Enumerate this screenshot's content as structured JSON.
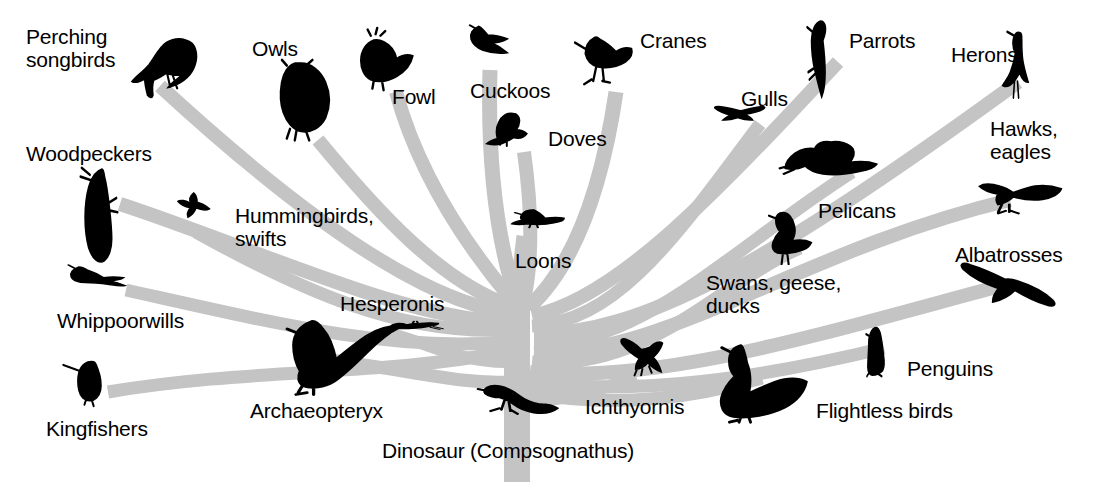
{
  "figure": {
    "kind": "phylogenetic-tree",
    "background_color": "#ffffff",
    "branch_color": "#c4c4c4",
    "silhouette_color": "#000000",
    "root_label": "Dinosaur (Compsognathus)"
  },
  "chart_data": {
    "type": "diagram",
    "title": "",
    "root": "Dinosaur (Compsognathus)",
    "node_count": 24,
    "tips": [
      "Perching songbirds",
      "Woodpeckers",
      "Hummingbirds, swifts",
      "Whippoorwills",
      "Kingfishers",
      "Owls",
      "Fowl",
      "Cuckoos",
      "Doves",
      "Cranes",
      "Parrots",
      "Gulls",
      "Herons",
      "Hawks, eagles",
      "Pelicans",
      "Albatrosses",
      "Swans, geese, ducks",
      "Penguins",
      "Flightless birds",
      "Loons",
      "Hesperonis",
      "Archaeopteryx",
      "Ichthyornis"
    ]
  },
  "taxa": [
    {
      "id": "perching-songbirds",
      "label": "Perching\nsongbirds",
      "icon": "songbird-icon",
      "label_x": 26,
      "label_y": 26,
      "label_align": "left",
      "sil_x": 131,
      "sil_y": 36,
      "sil_w": 70,
      "sil_h": 62,
      "sil_kind": "songbird"
    },
    {
      "id": "woodpeckers",
      "label": "Woodpeckers",
      "icon": "woodpecker-icon",
      "label_x": 26,
      "label_y": 143,
      "label_align": "left",
      "sil_x": 78,
      "sil_y": 166,
      "sil_w": 60,
      "sil_h": 80,
      "sil_kind": "woodpecker"
    },
    {
      "id": "hummingbirds-swifts",
      "label": "Hummingbirds,\nswifts",
      "icon": "hummingbird-icon",
      "label_x": 235,
      "label_y": 205,
      "label_align": "left",
      "sil_x": 178,
      "sil_y": 192,
      "sil_w": 56,
      "sil_h": 42,
      "sil_kind": "hummingbird"
    },
    {
      "id": "whippoorwills",
      "label": "Whippoorwills",
      "icon": "whippoorwill-icon",
      "label_x": 57,
      "label_y": 310,
      "label_align": "left",
      "sil_x": 67,
      "sil_y": 264,
      "sil_w": 76,
      "sil_h": 44,
      "sil_kind": "whippoorwill"
    },
    {
      "id": "kingfishers",
      "label": "Kingfishers",
      "icon": "kingfisher-icon",
      "label_x": 46,
      "label_y": 418,
      "label_align": "left",
      "sil_x": 62,
      "sil_y": 355,
      "sil_w": 66,
      "sil_h": 64,
      "sil_kind": "kingfisher"
    },
    {
      "id": "owls",
      "label": "Owls",
      "icon": "owl-icon",
      "label_x": 252,
      "label_y": 38,
      "label_align": "left",
      "sil_x": 266,
      "sil_y": 60,
      "sil_w": 80,
      "sil_h": 84,
      "sil_kind": "owl"
    },
    {
      "id": "fowl",
      "label": "Fowl",
      "icon": "fowl-icon",
      "label_x": 392,
      "label_y": 86,
      "label_align": "left",
      "sil_x": 350,
      "sil_y": 28,
      "sil_w": 80,
      "sil_h": 70,
      "sil_kind": "fowl"
    },
    {
      "id": "cuckoos",
      "label": "Cuckoos",
      "icon": "cuckoo-icon",
      "label_x": 470,
      "label_y": 80,
      "label_align": "left",
      "sil_x": 461,
      "sil_y": 24,
      "sil_w": 74,
      "sil_h": 56,
      "sil_kind": "cuckoo"
    },
    {
      "id": "doves",
      "label": "Doves",
      "icon": "dove-icon",
      "label_x": 548,
      "label_y": 128,
      "label_align": "left",
      "sil_x": 487,
      "sil_y": 110,
      "sil_w": 66,
      "sil_h": 56,
      "sil_kind": "dove"
    },
    {
      "id": "cranes",
      "label": "Cranes",
      "icon": "crane-icon",
      "label_x": 640,
      "label_y": 30,
      "label_align": "left",
      "sil_x": 575,
      "sil_y": 25,
      "sil_w": 76,
      "sil_h": 72,
      "sil_kind": "crane"
    },
    {
      "id": "parrots",
      "label": "Parrots",
      "icon": "parrot-icon",
      "label_x": 849,
      "label_y": 30,
      "label_align": "left",
      "sil_x": 806,
      "sil_y": 18,
      "sil_w": 56,
      "sil_h": 84,
      "sil_kind": "parrot"
    },
    {
      "id": "herons",
      "label": "Herons",
      "icon": "heron-icon",
      "label_x": 951,
      "label_y": 44,
      "label_align": "left",
      "sil_x": 1003,
      "sil_y": 30,
      "sil_w": 52,
      "sil_h": 80,
      "sil_kind": "heron"
    },
    {
      "id": "gulls",
      "label": "Gulls",
      "icon": "gull-icon",
      "label_x": 741,
      "label_y": 88,
      "label_align": "left",
      "sil_x": 714,
      "sil_y": 105,
      "sil_w": 74,
      "sil_h": 38,
      "sil_kind": "gull"
    },
    {
      "id": "hawks-eagles",
      "label": "Hawks,\neagles",
      "icon": "hawk-icon",
      "label_x": 990,
      "label_y": 118,
      "label_align": "left",
      "sil_x": 978,
      "sil_y": 176,
      "sil_w": 92,
      "sil_h": 58,
      "sil_kind": "hawk"
    },
    {
      "id": "pelicans",
      "label": "Pelicans",
      "icon": "pelican-icon",
      "label_x": 818,
      "label_y": 200,
      "label_align": "left",
      "sil_x": 780,
      "sil_y": 138,
      "sil_w": 98,
      "sil_h": 62,
      "sil_kind": "pelican"
    },
    {
      "id": "albatrosses",
      "label": "Albatrosses",
      "icon": "albatross-icon",
      "label_x": 955,
      "label_y": 244,
      "label_align": "left",
      "sil_x": 960,
      "sil_y": 262,
      "sil_w": 98,
      "sil_h": 66,
      "sil_kind": "albatross"
    },
    {
      "id": "swans-geese-ducks",
      "label": "Swans, geese,\nducks",
      "icon": "goose-icon",
      "label_x": 706,
      "label_y": 272,
      "label_align": "left",
      "sil_x": 762,
      "sil_y": 210,
      "sil_w": 70,
      "sil_h": 64,
      "sil_kind": "goose"
    },
    {
      "id": "penguins",
      "label": "Penguins",
      "icon": "penguin-icon",
      "label_x": 907,
      "label_y": 358,
      "label_align": "left",
      "sil_x": 866,
      "sil_y": 325,
      "sil_w": 44,
      "sil_h": 68,
      "sil_kind": "penguin"
    },
    {
      "id": "flightless-birds",
      "label": "Flightless birds",
      "icon": "emu-icon",
      "label_x": 816,
      "label_y": 400,
      "label_align": "left",
      "sil_x": 716,
      "sil_y": 340,
      "sil_w": 96,
      "sil_h": 86,
      "sil_kind": "emu"
    },
    {
      "id": "loons",
      "label": "Loons",
      "icon": "loon-icon",
      "label_x": 515,
      "label_y": 250,
      "label_align": "left",
      "sil_x": 512,
      "sil_y": 208,
      "sil_w": 72,
      "sil_h": 42,
      "sil_kind": "loon"
    },
    {
      "id": "hesperonis",
      "label": "Hesperonis",
      "icon": "hesperonis-icon",
      "label_x": 340,
      "label_y": 293,
      "label_align": "left",
      "sil_x": 388,
      "sil_y": 320,
      "sil_w": 76,
      "sil_h": 30,
      "sil_kind": "hesperonis"
    },
    {
      "id": "archaeopteryx",
      "label": "Archaeopteryx",
      "icon": "archaeopteryx-icon",
      "label_x": 250,
      "label_y": 400,
      "label_align": "left",
      "sil_x": 285,
      "sil_y": 318,
      "sil_w": 110,
      "sil_h": 82,
      "sil_kind": "archaeopteryx"
    },
    {
      "id": "ichthyornis",
      "label": "Ichthyornis",
      "icon": "ichthyornis-icon",
      "label_x": 585,
      "label_y": 396,
      "label_align": "left",
      "sil_x": 620,
      "sil_y": 338,
      "sil_w": 66,
      "sil_h": 58,
      "sil_kind": "ichthyornis"
    },
    {
      "id": "dinosaur-root",
      "label": "Dinosaur (Compsognathus)",
      "icon": "compsognathus-icon",
      "label_x": 382,
      "label_y": 440,
      "label_align": "left",
      "sil_x": 478,
      "sil_y": 378,
      "sil_w": 90,
      "sil_h": 62,
      "sil_kind": "compsognathus"
    }
  ],
  "branches": [
    {
      "id": "trunk",
      "d": "M 517,482 L 517,300"
    },
    {
      "id": "branch-loons",
      "d": "M 517,330 C 517,290 520,270 524,236"
    },
    {
      "id": "branch-cuckoos",
      "d": "M 517,300 C 500,250 487,180 490,70"
    },
    {
      "id": "branch-fowl",
      "d": "M 512,300 C 470,250 420,180 396,92"
    },
    {
      "id": "branch-owls",
      "d": "M 508,305 C 440,280 380,215 318,140"
    },
    {
      "id": "branch-songbirds",
      "d": "M 506,312 C 420,300 300,215 160,86"
    },
    {
      "id": "branch-woodpeckers",
      "d": "M 506,322 C 400,318 260,250 120,204"
    },
    {
      "id": "branch-hummingbirds",
      "d": "M 506,330 C 400,335 300,290 196,232"
    },
    {
      "id": "branch-whippoorwills",
      "d": "M 505,342 C 390,352 270,322 126,290"
    },
    {
      "id": "branch-kingfishers",
      "d": "M 505,352 C 380,376 250,368 108,392"
    },
    {
      "id": "branch-hesperonis",
      "d": "M 506,362 C 460,362 430,344 392,334"
    },
    {
      "id": "branch-archaeopteryx",
      "d": "M 508,382 C 460,384 420,372 330,360"
    },
    {
      "id": "branch-doves",
      "d": "M 524,300 C 535,250 530,195 524,152"
    },
    {
      "id": "branch-cranes",
      "d": "M 528,308 C 570,270 600,200 616,92"
    },
    {
      "id": "branch-parrots",
      "d": "M 532,316 C 610,300 700,212 838,62"
    },
    {
      "id": "branch-gulls",
      "d": "M 532,326 C 620,322 680,230 760,124"
    },
    {
      "id": "branch-herons",
      "d": "M 534,334 C 640,334 760,270 1018,82"
    },
    {
      "id": "branch-pelicans",
      "d": "M 534,344 C 640,348 730,250 852,172"
    },
    {
      "id": "branch-hawks",
      "d": "M 534,352 C 660,360 800,250 1010,200"
    },
    {
      "id": "branch-swans",
      "d": "M 532,362 C 650,372 720,282 800,248"
    },
    {
      "id": "branch-albatrosses",
      "d": "M 530,372 C 660,384 820,334 1000,286"
    },
    {
      "id": "branch-penguins",
      "d": "M 528,382 C 640,396 760,378 884,348"
    },
    {
      "id": "branch-flightless",
      "d": "M 524,392 C 620,410 700,396 762,378"
    },
    {
      "id": "branch-ichthyornis",
      "d": "M 522,400 C 570,402 600,390 636,376"
    }
  ]
}
